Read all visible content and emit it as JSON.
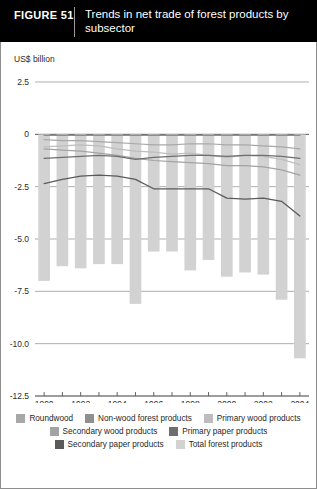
{
  "header": {
    "figure_label": "FIGURE  51",
    "title": "Trends in net trade of forest products by subsector",
    "background_color": "#000000",
    "text_color": "#ffffff"
  },
  "axis_unit_label": "US$ billion",
  "legend": {
    "rows": [
      [
        {
          "label": "Roundwood",
          "color": "#a8a8a8"
        },
        {
          "label": "Non-wood forest products",
          "color": "#8f8f8f"
        },
        {
          "label": "Primary wood products",
          "color": "#bdbdbd"
        }
      ],
      [
        {
          "label": "Secondary wood products",
          "color": "#a3a3a3"
        },
        {
          "label": "Primary paper products",
          "color": "#6e6e6e"
        }
      ],
      [
        {
          "label": "Secondary paper products",
          "color": "#5a5a5a"
        },
        {
          "label": "Total forest products",
          "color": "#d2d2d2"
        }
      ]
    ]
  },
  "chart_data": {
    "type": "bar",
    "title": "Trends in net trade of forest products by subsector",
    "xlabel": "",
    "ylabel": "US$ billion",
    "ylim": [
      -12.5,
      2.5
    ],
    "yticks": [
      2.5,
      0,
      -2.5,
      -5.0,
      -7.5,
      -10.0,
      -12.5
    ],
    "ytick_labels": [
      "2.5",
      "0",
      "-2.5",
      "-5.0",
      "-7.5",
      "-10.0",
      "-12.5"
    ],
    "grid": true,
    "legend_position": "bottom",
    "x": [
      1990,
      1991,
      1992,
      1993,
      1994,
      1995,
      1996,
      1997,
      1998,
      1999,
      2000,
      2001,
      2002,
      2003,
      2004
    ],
    "xtick_labels": [
      "1990",
      "",
      "1992",
      "",
      "1994",
      "",
      "1996",
      "",
      "1998",
      "",
      "2000",
      "",
      "2002",
      "",
      "2004"
    ],
    "bar_series": {
      "name": "Total forest products",
      "color": "#d2d2d2",
      "values": [
        -7.0,
        -6.3,
        -6.4,
        -6.2,
        -6.2,
        -8.1,
        -5.6,
        -5.6,
        -6.5,
        -6.0,
        -6.8,
        -6.6,
        -6.7,
        -7.9,
        -10.7
      ]
    },
    "series": [
      {
        "name": "Roundwood",
        "color": "#a8a8a8",
        "type": "line",
        "values": [
          -0.25,
          -0.3,
          -0.3,
          -0.35,
          -0.4,
          -0.45,
          -0.5,
          -0.5,
          -0.45,
          -0.45,
          -0.5,
          -0.5,
          -0.55,
          -0.6,
          -0.7
        ]
      },
      {
        "name": "Non-wood forest products",
        "color": "#8f8f8f",
        "type": "line",
        "values": [
          -0.05,
          -0.05,
          -0.05,
          -0.05,
          -0.05,
          -0.05,
          -0.05,
          -0.05,
          -0.05,
          -0.05,
          -0.05,
          -0.05,
          -0.05,
          -0.05,
          -0.05
        ]
      },
      {
        "name": "Primary wood products",
        "color": "#bdbdbd",
        "type": "line",
        "values": [
          -0.6,
          -0.55,
          -0.5,
          -0.55,
          -0.7,
          -0.8,
          -0.85,
          -0.95,
          -0.9,
          -1.0,
          -1.1,
          -1.0,
          -1.05,
          -1.2,
          -1.45
        ]
      },
      {
        "name": "Secondary wood products",
        "color": "#a3a3a3",
        "type": "line",
        "values": [
          -0.7,
          -0.75,
          -0.8,
          -0.9,
          -1.0,
          -1.15,
          -1.25,
          -1.3,
          -1.35,
          -1.4,
          -1.5,
          -1.5,
          -1.55,
          -1.7,
          -1.95
        ]
      },
      {
        "name": "Primary paper products",
        "color": "#6e6e6e",
        "type": "line",
        "values": [
          -1.15,
          -1.1,
          -1.05,
          -1.0,
          -1.05,
          -1.2,
          -1.1,
          -1.05,
          -1.0,
          -1.0,
          -1.05,
          -1.0,
          -1.0,
          -1.05,
          -1.15
        ]
      },
      {
        "name": "Secondary paper products",
        "color": "#5a5a5a",
        "type": "line",
        "values": [
          -2.35,
          -2.15,
          -2.0,
          -1.95,
          -2.0,
          -2.15,
          -2.6,
          -2.6,
          -2.6,
          -2.6,
          -3.05,
          -3.1,
          -3.05,
          -3.2,
          -3.9
        ]
      }
    ]
  }
}
